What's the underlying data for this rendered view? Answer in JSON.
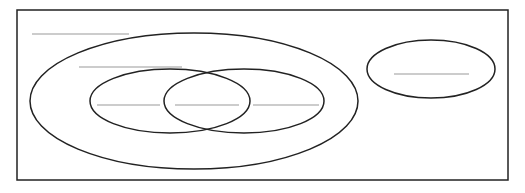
{
  "diagram": {
    "type": "venn-diagram-blank",
    "colors": {
      "outline": "#222222",
      "blank_line": "#999999",
      "background": "#ffffff"
    },
    "frame": {
      "x": 17,
      "y": 10,
      "w": 491,
      "h": 170
    },
    "sets": [
      {
        "id": "outer-set",
        "cx": 194,
        "cy": 101,
        "rx": 164,
        "ry": 68
      },
      {
        "id": "inner-left-set",
        "cx": 170,
        "cy": 101,
        "rx": 80,
        "ry": 32
      },
      {
        "id": "inner-right-set",
        "cx": 244,
        "cy": 101,
        "rx": 80,
        "ry": 32
      },
      {
        "id": "separate-set",
        "cx": 431,
        "cy": 69,
        "rx": 64,
        "ry": 29
      }
    ],
    "blanks": [
      {
        "id": "universe-label-blank",
        "x1": 32,
        "x2": 129,
        "y": 34
      },
      {
        "id": "outer-set-label-blank",
        "x1": 79,
        "x2": 182,
        "y": 67
      },
      {
        "id": "left-only-blank",
        "x1": 97,
        "x2": 160,
        "y": 105
      },
      {
        "id": "intersection-blank",
        "x1": 175,
        "x2": 239,
        "y": 105
      },
      {
        "id": "right-only-blank",
        "x1": 253,
        "x2": 319,
        "y": 105
      },
      {
        "id": "separate-set-blank",
        "x1": 394,
        "x2": 469,
        "y": 74
      }
    ]
  }
}
